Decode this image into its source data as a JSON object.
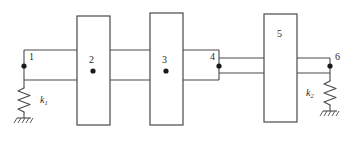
{
  "figure": {
    "type": "mechanical-schematic",
    "width": 360,
    "height": 141,
    "background": "#ffffff",
    "line_color": "#4a4a4a",
    "node_color": "#1a1a1a",
    "text_color": "#2b2b2b"
  },
  "labels": {
    "node1": "1",
    "node2": "2",
    "node3": "3",
    "node4": "4",
    "node5": "5",
    "node6": "6",
    "spring_left_symbol": "k",
    "spring_left_sub": "1",
    "spring_right_symbol": "k",
    "spring_right_sub": "2"
  },
  "elements": {
    "disks": [
      {
        "id": "disk-2",
        "label": "2",
        "x": 77,
        "y": 16,
        "width": 33,
        "height": 109
      },
      {
        "id": "disk-3",
        "label": "3",
        "x": 150,
        "y": 13,
        "width": 33,
        "height": 112
      },
      {
        "id": "disk-5",
        "label": "5",
        "x": 264,
        "y": 14,
        "width": 33,
        "height": 108
      }
    ],
    "nodes": [
      {
        "id": "node-1",
        "label": "1",
        "cx": 24,
        "cy": 66
      },
      {
        "id": "node-2",
        "label": "2",
        "cx": 93,
        "cy": 71
      },
      {
        "id": "node-3",
        "label": "3",
        "cx": 166,
        "cy": 71
      },
      {
        "id": "node-4",
        "label": "4",
        "cx": 219,
        "cy": 66
      },
      {
        "id": "node-5",
        "label": "5",
        "cx": 280,
        "cy": 35
      },
      {
        "id": "node-6",
        "label": "6",
        "cx": 330,
        "cy": 66
      }
    ],
    "shafts": [
      {
        "id": "shaft-thick-left",
        "x1": 24,
        "x2": 219,
        "top": 50,
        "bottom": 80
      },
      {
        "id": "shaft-thin-right",
        "x1": 219,
        "x2": 330,
        "top": 58,
        "bottom": 73
      }
    ],
    "springs": [
      {
        "id": "spring-k1",
        "x": 24,
        "top": 80,
        "bottom": 124,
        "label": "k1",
        "ground": true
      },
      {
        "id": "spring-k2",
        "x": 330,
        "top": 73,
        "bottom": 117,
        "label": "k2",
        "ground": true
      }
    ]
  }
}
